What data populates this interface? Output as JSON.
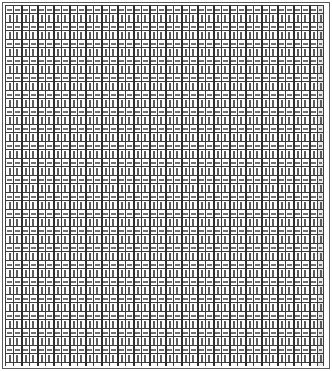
{
  "document": {
    "title": "Dense ruled ledger sheet",
    "kind": "tabular-grid",
    "description": "Full-page ruled grid of narrow cells, rows alternating between short horizontal dashes and thin vertical tick strokes, closed by a sparse bottom row.",
    "background_color": "#ffffff",
    "border_color": "#5a5a5a"
  },
  "grid": {
    "columns": 40,
    "rows": 44,
    "column_pitch_px": 8,
    "column_group_size": 2,
    "cell_fill_dash": "#dcdcdc",
    "cell_fill_tick": "#f2f2f2",
    "mark_color_dash": "#6f6f6f",
    "mark_color_tick": "#5c5c5c",
    "gridline_color": "#3c3c3c",
    "group_rule_color": "#2e2e2e",
    "has_tail_column": true,
    "row_pattern": [
      "dash",
      "tick",
      "dash",
      "tick",
      "dash",
      "tick",
      "dash",
      "tick",
      "dash",
      "tick",
      "dash",
      "tick",
      "dash",
      "tick",
      "dash",
      "tick",
      "dash",
      "tick",
      "dash",
      "tick",
      "dash",
      "tick",
      "dash",
      "tick",
      "dash",
      "tick",
      "dash",
      "tick",
      "dash",
      "tick",
      "dash",
      "tick",
      "dash",
      "tick",
      "dash",
      "tick",
      "dash",
      "tick",
      "dash",
      "tick",
      "dash",
      "tick",
      "dash",
      "foot"
    ]
  },
  "footer_row": {
    "label": "closing row",
    "filled_column_indices": [
      0,
      5,
      10,
      15,
      20,
      25,
      30,
      35,
      39
    ]
  }
}
